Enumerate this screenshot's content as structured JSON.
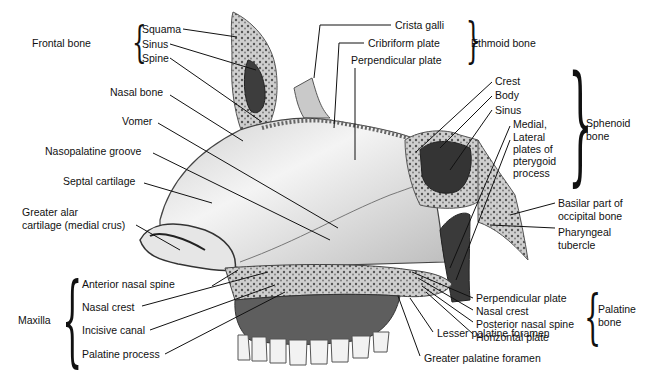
{
  "groups": {
    "frontal": {
      "name": "Frontal bone",
      "parts": [
        "Squama",
        "Sinus",
        "Spine"
      ]
    },
    "ethmoid": {
      "name": "Ethmoid bone",
      "parts": [
        "Crista galli",
        "Cribriform plate",
        "Perpendicular plate"
      ]
    },
    "sphenoid": {
      "name": "Sphenoid\nbone",
      "name_lines": [
        "Sphenoid",
        "bone"
      ],
      "parts": [
        "Crest",
        "Body",
        "Sinus"
      ],
      "pterygoid_lines": [
        "Medial,",
        "Lateral",
        "plates of",
        "pterygoid",
        "process"
      ]
    },
    "maxilla": {
      "name": "Maxilla",
      "parts": [
        "Anterior nasal spine",
        "Nasal crest",
        "Incisive canal",
        "Palatine process"
      ]
    },
    "palatine": {
      "name_lines": [
        "Palatine",
        "bone"
      ],
      "parts": [
        "Perpendicular plate",
        "Nasal crest",
        "Posterior nasal spine",
        "Horizontal plate"
      ]
    }
  },
  "labels": {
    "nasal_bone": "Nasal bone",
    "vomer": "Vomer",
    "nasopalatine_groove": "Nasopalatine groove",
    "septal_cartilage": "Septal cartilage",
    "greater_alar_1": "Greater alar",
    "greater_alar_2": "cartilage (medial crus)",
    "basilar_1": "Basilar part of",
    "basilar_2": "occipital bone",
    "pharyngeal_1": "Pharyngeal",
    "pharyngeal_2": "tubercle",
    "lesser_palatine": "Lesser palatine foramen",
    "greater_palatine": "Greater palatine foramen"
  },
  "colors": {
    "bone": "#d9d9d9",
    "bone_dark": "#5a5a5a",
    "sinus": "#3a3a3a",
    "line": "#111111",
    "background": "#ffffff"
  }
}
